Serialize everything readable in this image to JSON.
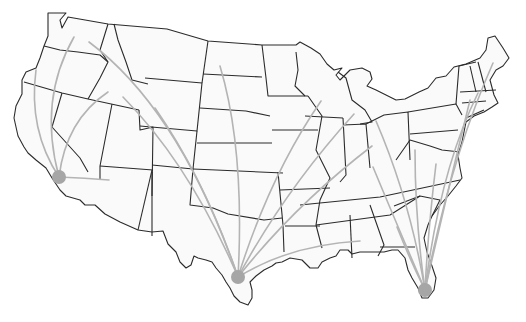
{
  "map": {
    "title": "",
    "background": "#ffffff",
    "land_fill": "#fafafa",
    "border_color": "#2b2b2b",
    "arc_color": "#b4b4b4",
    "hub_color": "#a6a6a6"
  },
  "hubs": [
    {
      "name": "west-coast-hub",
      "x": 59,
      "y": 177,
      "r": 7
    },
    {
      "name": "texas-hub",
      "x": 238,
      "y": 277,
      "r": 7
    },
    {
      "name": "florida-hub",
      "x": 425,
      "y": 290,
      "r": 7
    }
  ],
  "arcs": [
    {
      "hub": 0,
      "to": [
        36,
        70
      ],
      "c": [
        28,
        130
      ]
    },
    {
      "hub": 0,
      "to": [
        74,
        37
      ],
      "c": [
        38,
        100
      ]
    },
    {
      "hub": 0,
      "to": [
        108,
        92
      ],
      "c": [
        66,
        120
      ]
    },
    {
      "hub": 0,
      "to": [
        109,
        180
      ],
      "c": [
        85,
        178
      ]
    },
    {
      "hub": 1,
      "to": [
        89,
        42
      ],
      "c": [
        180,
        110
      ]
    },
    {
      "hub": 1,
      "to": [
        123,
        97
      ],
      "c": [
        190,
        165
      ]
    },
    {
      "hub": 1,
      "to": [
        155,
        108
      ],
      "c": [
        205,
        180
      ]
    },
    {
      "hub": 1,
      "to": [
        220,
        66
      ],
      "c": [
        245,
        150
      ]
    },
    {
      "hub": 1,
      "to": [
        321,
        101
      ],
      "c": [
        270,
        175
      ]
    },
    {
      "hub": 1,
      "to": [
        354,
        114
      ],
      "c": [
        285,
        190
      ]
    },
    {
      "hub": 1,
      "to": [
        372,
        146
      ],
      "c": [
        295,
        205
      ]
    },
    {
      "hub": 1,
      "to": [
        360,
        241
      ],
      "c": [
        290,
        245
      ]
    },
    {
      "hub": 2,
      "to": [
        373,
        167
      ],
      "c": [
        395,
        220
      ]
    },
    {
      "hub": 2,
      "to": [
        376,
        121
      ],
      "c": [
        410,
        200
      ]
    },
    {
      "hub": 2,
      "to": [
        415,
        150
      ],
      "c": [
        415,
        220
      ]
    },
    {
      "hub": 2,
      "to": [
        397,
        227
      ],
      "c": [
        410,
        260
      ]
    },
    {
      "hub": 2,
      "to": [
        436,
        164
      ],
      "c": [
        428,
        230
      ]
    },
    {
      "hub": 2,
      "to": [
        478,
        93
      ],
      "c": [
        440,
        170
      ]
    },
    {
      "hub": 2,
      "to": [
        493,
        63
      ],
      "c": [
        450,
        160
      ]
    },
    {
      "hub": 2,
      "to": [
        470,
        100
      ],
      "c": [
        448,
        190
      ]
    }
  ],
  "labels": []
}
